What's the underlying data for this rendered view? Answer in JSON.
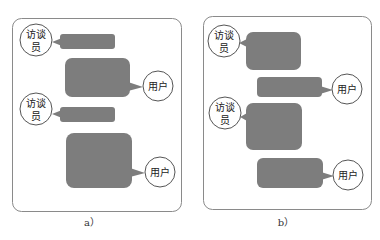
{
  "colors": {
    "bubble_fill": "#7d7d7d",
    "border": "#8a8a8a",
    "circle_stroke": "#555555"
  },
  "labels": {
    "interviewer_line1": "访谈",
    "interviewer_line2": "员",
    "user": "用户"
  },
  "panels": [
    {
      "id": "a",
      "caption": "a）",
      "description": "Interviewer short prompts, user long responses"
    },
    {
      "id": "b",
      "caption": "b）",
      "description": "Interviewer long prompts, user short responses"
    }
  ]
}
